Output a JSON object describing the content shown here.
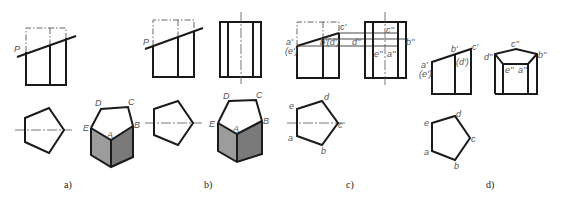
{
  "figure": {
    "colors": {
      "line": "#1a1a1a",
      "label": "#555555",
      "face_light": "#9c9c9c",
      "face_dark": "#7a7a7a"
    },
    "panels": [
      {
        "id": "a",
        "caption": "a)",
        "plane_label": "P",
        "iso_labels": {
          "D": "D",
          "C": "C",
          "B": "B",
          "A": "A",
          "E": "E"
        }
      },
      {
        "id": "b",
        "caption": "b)",
        "plane_label": "P",
        "iso_labels": {
          "D": "D",
          "C": "C",
          "B": "B",
          "A": "A",
          "E": "E"
        }
      },
      {
        "id": "c",
        "caption": "c)",
        "front_labels": {
          "a": "a'",
          "e": "(e')",
          "b": "b'(d')",
          "c": "c'"
        },
        "side_labels": {
          "c": "c''",
          "d": "d''",
          "b": "b''",
          "e": "e''",
          "a": "a''"
        },
        "top_labels": {
          "a": "a",
          "b": "b",
          "c": "c",
          "d": "d",
          "e": "e"
        }
      },
      {
        "id": "d",
        "caption": "d)",
        "front_labels": {
          "a": "a'",
          "e": "(e')",
          "b": "b'",
          "d": "(d')",
          "c": "c'"
        },
        "side_labels": {
          "c": "c''",
          "d": "d''",
          "b": "b''",
          "e": "e''",
          "a": "a''"
        },
        "top_labels": {
          "a": "a",
          "b": "b",
          "c": "c",
          "d": "d",
          "e": "e"
        }
      }
    ]
  }
}
